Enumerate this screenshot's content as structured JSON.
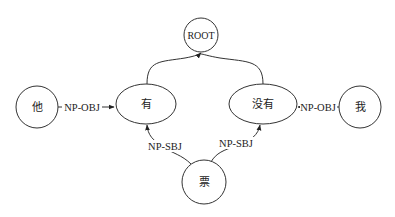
{
  "diagram": {
    "type": "dependency-graph",
    "nodes": [
      {
        "id": "root",
        "label": "ROOT",
        "shape": "circle"
      },
      {
        "id": "ta",
        "label": "他",
        "shape": "circle"
      },
      {
        "id": "you",
        "label": "有",
        "shape": "ellipse"
      },
      {
        "id": "meiyou",
        "label": "没有",
        "shape": "ellipse"
      },
      {
        "id": "wo",
        "label": "我",
        "shape": "circle"
      },
      {
        "id": "piao",
        "label": "票",
        "shape": "circle"
      }
    ],
    "edges": [
      {
        "from": "you",
        "to": "root",
        "label": ""
      },
      {
        "from": "meiyou",
        "to": "root",
        "label": ""
      },
      {
        "from": "ta",
        "to": "you",
        "label": "NP-OBJ"
      },
      {
        "from": "wo",
        "to": "meiyou",
        "label": "NP-OBJ"
      },
      {
        "from": "piao",
        "to": "you",
        "label": "NP-SBJ"
      },
      {
        "from": "piao",
        "to": "meiyou",
        "label": "NP-SBJ"
      }
    ],
    "colors": {
      "stroke": "#333333",
      "background": "#ffffff",
      "text": "#222222"
    }
  }
}
